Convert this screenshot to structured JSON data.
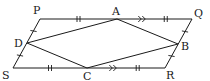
{
  "diagram": {
    "stroke_color": "#1a1a1a",
    "background": "#ffffff",
    "points": {
      "P": {
        "label": "P",
        "x": 40,
        "y": 19,
        "lx": 33,
        "ly": 14
      },
      "Q": {
        "label": "Q",
        "x": 192,
        "y": 19,
        "lx": 194,
        "ly": 17
      },
      "R": {
        "label": "R",
        "x": 165,
        "y": 68,
        "lx": 166,
        "ly": 79
      },
      "S": {
        "label": "S",
        "x": 13,
        "y": 68,
        "lx": 2,
        "ly": 79
      },
      "A": {
        "label": "A",
        "x": 117,
        "y": 19,
        "lx": 112,
        "ly": 15
      },
      "B": {
        "label": "B",
        "x": 178,
        "y": 44,
        "lx": 181,
        "ly": 50
      },
      "C": {
        "label": "C",
        "x": 87,
        "y": 68,
        "lx": 83,
        "ly": 80
      },
      "D": {
        "label": "D",
        "x": 27,
        "y": 43,
        "lx": 14,
        "ly": 47
      }
    },
    "outer_shape": [
      "P",
      "Q",
      "R",
      "S"
    ],
    "inner_shape": [
      "A",
      "B",
      "C",
      "D"
    ],
    "markings": [
      {
        "type": "double-tick",
        "segment": [
          "P",
          "A"
        ],
        "meaning": "PA = CR"
      },
      {
        "type": "double-tick",
        "segment": [
          "A",
          "Q"
        ],
        "meaning": "AQ = SC"
      },
      {
        "type": "double-arrow",
        "segment": [
          "A",
          "Q"
        ],
        "meaning": "parallel"
      },
      {
        "type": "double-tick",
        "segment": [
          "S",
          "C"
        ],
        "meaning": "SC = AQ"
      },
      {
        "type": "double-arrow",
        "segment": [
          "C",
          "R"
        ],
        "meaning": "parallel"
      },
      {
        "type": "double-tick",
        "segment": [
          "C",
          "R"
        ],
        "meaning": "CR = PA"
      },
      {
        "type": "single-tick",
        "segment": [
          "P",
          "D"
        ],
        "meaning": "PD = DS"
      },
      {
        "type": "single-tick",
        "segment": [
          "D",
          "S"
        ],
        "meaning": "DS = PD"
      },
      {
        "type": "single-tick",
        "segment": [
          "Q",
          "B"
        ],
        "meaning": "QB = BR"
      },
      {
        "type": "single-tick",
        "segment": [
          "B",
          "R"
        ],
        "meaning": "BR = QB"
      }
    ]
  }
}
